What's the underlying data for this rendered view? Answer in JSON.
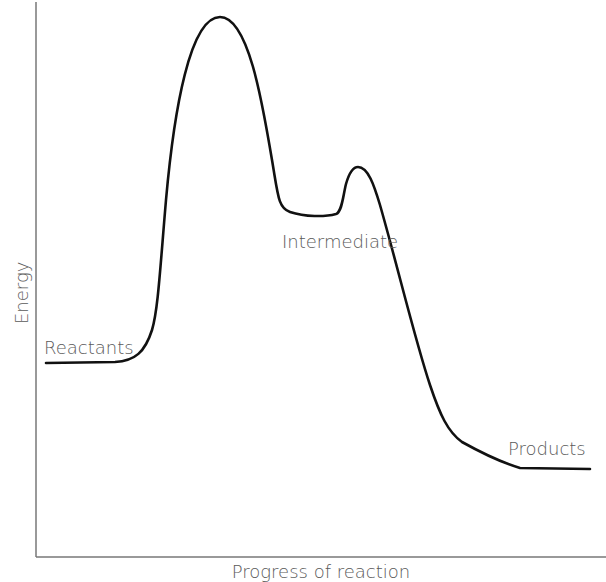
{
  "diagram": {
    "type": "energy-profile",
    "axes": {
      "y_label": "Energy",
      "x_label": "Progress of reaction"
    },
    "labels": {
      "reactants": "Reactants",
      "intermediate": "Intermediate",
      "products": "Products"
    },
    "colors": {
      "curve": "#111111",
      "axis": "#777777",
      "text": "#5a5a5a"
    },
    "curve_points": [
      {
        "x": 46,
        "y": 363,
        "note": "reactants level"
      },
      {
        "x": 130,
        "y": 359
      },
      {
        "x": 220,
        "y": 17,
        "note": "transition state 1"
      },
      {
        "x": 282,
        "y": 210
      },
      {
        "x": 340,
        "y": 214,
        "note": "intermediate well"
      },
      {
        "x": 358,
        "y": 168,
        "note": "transition state 2"
      },
      {
        "x": 455,
        "y": 440
      },
      {
        "x": 520,
        "y": 468
      },
      {
        "x": 590,
        "y": 469,
        "note": "products level"
      }
    ]
  }
}
